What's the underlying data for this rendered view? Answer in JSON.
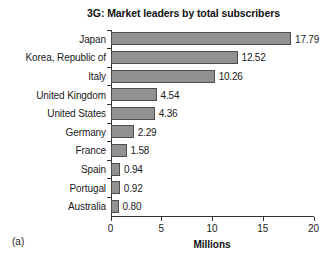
{
  "figure": {
    "panel_label": "(a)"
  },
  "chart_data": {
    "type": "bar",
    "orientation": "horizontal",
    "title": "3G: Market leaders by total subscribers",
    "xlabel": "Millions",
    "ylabel": "",
    "categories": [
      "Japan",
      "Korea, Republic of",
      "Italy",
      "United Kingdom",
      "United States",
      "Germany",
      "France",
      "Spain",
      "Portugal",
      "Australia"
    ],
    "values": [
      17.79,
      12.52,
      10.26,
      4.54,
      4.36,
      2.29,
      1.58,
      0.94,
      0.92,
      0.8
    ],
    "value_labels": [
      "17.79",
      "12.52",
      "10.26",
      "4.54",
      "4.36",
      "2.29",
      "1.58",
      "0.94",
      "0.92",
      "0.80"
    ],
    "xlim": [
      0,
      20
    ],
    "xticks": [
      0,
      5,
      10,
      15,
      20
    ],
    "xtick_labels": [
      "0",
      "5",
      "10",
      "15",
      "20"
    ],
    "grid": false,
    "legend": false,
    "bar_color": "#919191",
    "bar_edge_color": "#4d4d4d",
    "axis_color": "#333333",
    "text_color": "#1a1a1a"
  }
}
